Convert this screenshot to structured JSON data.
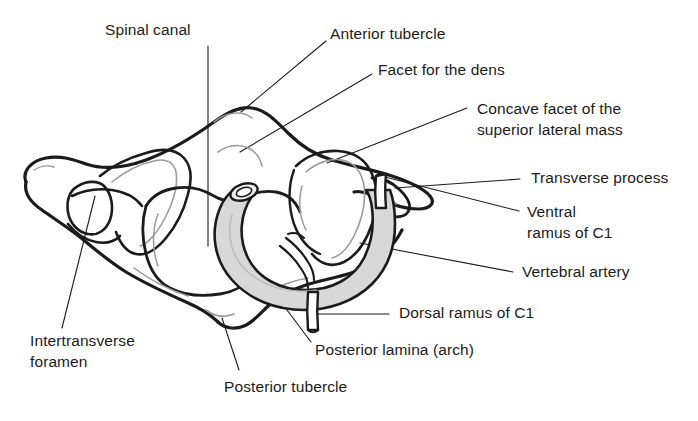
{
  "figure": {
    "background_color": "#ffffff",
    "line_color": "#1b1b1b",
    "inner_line_color": "#9a9a9a",
    "artery_fill": "#d8d8d8",
    "text_color": "#1b1b1b"
  },
  "labels": {
    "spinal_canal": "Spinal canal",
    "anterior_tubercle": "Anterior tubercle",
    "facet_for_the_dens": "Facet for the dens",
    "concave_facet_line1": "Concave facet of the",
    "concave_facet_line2": "superior lateral mass",
    "transverse_process": "Transverse process",
    "ventral_ramus_line1": "Ventral",
    "ventral_ramus_line2": "ramus of C1",
    "vertebral_artery": "Vertebral artery",
    "dorsal_ramus": "Dorsal ramus of C1",
    "posterior_lamina": "Posterior lamina (arch)",
    "posterior_tubercle": "Posterior tubercle",
    "intertransverse_line1": "Intertransverse",
    "intertransverse_line2": "foramen"
  }
}
